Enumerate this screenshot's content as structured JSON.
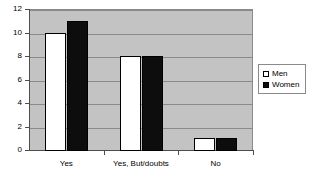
{
  "chart_data": {
    "type": "bar",
    "title": "",
    "subtitle": "",
    "xlabel": "",
    "ylabel": "",
    "categories": [
      "Yes",
      "Yes, But/doubts",
      "No"
    ],
    "series": [
      {
        "name": "Men",
        "values": [
          10,
          8,
          1
        ],
        "color": "#ffffff"
      },
      {
        "name": "Women",
        "values": [
          11,
          8,
          1
        ],
        "color": "#0d0d0d"
      }
    ],
    "ylim": [
      0,
      12
    ],
    "ytick_labels": [
      "12",
      "10",
      "8",
      "6",
      "4",
      "2",
      "0"
    ],
    "ytick_values": [
      12,
      10,
      8,
      6,
      4,
      2,
      0
    ],
    "grid": true,
    "grid_axis": "y",
    "legend_position": "right",
    "legend_entries": [
      "Men",
      "Women"
    ],
    "plot_background": "#c3c3c3",
    "axis_color": "#4d4d4d",
    "gridline_color": "#8a8a8a"
  }
}
